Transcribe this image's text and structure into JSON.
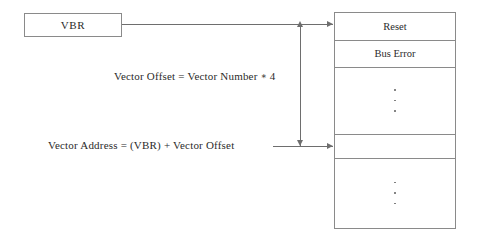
{
  "diagram": {
    "register_box": {
      "label": "VBR",
      "name": "vector-base-register"
    },
    "equations": {
      "offset": {
        "text": "Vector Offset = Vector Number",
        "operator": "∗",
        "operand": "4",
        "full": "Vector Offset = Vector Number ∗ 4"
      },
      "address": {
        "text": "Vector Address = (VBR) + Vector Offset",
        "full": "Vector Address = (VBR) + Vector Offset"
      }
    },
    "vector_table": {
      "name": "exception-vector-table",
      "rows": [
        {
          "label": "Reset",
          "kind": "labeled"
        },
        {
          "label": "Bus Error",
          "kind": "labeled"
        },
        {
          "label": "",
          "kind": "ellipsis",
          "dots": 3
        },
        {
          "label": "",
          "kind": "target"
        },
        {
          "label": "",
          "kind": "ellipsis",
          "dots": 3
        }
      ]
    },
    "connectors": {
      "vbr_to_table": {
        "label": "",
        "arrowhead": "right"
      },
      "address_to_table": {
        "label": "",
        "arrowhead": "right"
      },
      "offset_span_top": {
        "arrowhead": "up"
      },
      "offset_span_bottom": {
        "arrowhead": "down"
      }
    },
    "colors": {
      "stroke": "#8a8a8a",
      "line": "#6e6e6e",
      "text": "#2b2b2b",
      "background": "#ffffff"
    }
  }
}
